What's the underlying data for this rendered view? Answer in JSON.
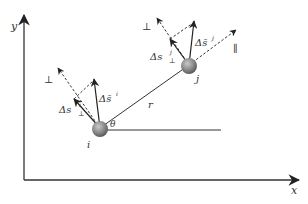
{
  "diagram": {
    "axes": {
      "x_label": "x",
      "y_label": "y"
    },
    "particles": [
      {
        "id": "i",
        "label": "i"
      },
      {
        "id": "j",
        "label": "j"
      }
    ],
    "separation_label": "r",
    "angle_label": "θ",
    "particle_i": {
      "perp_disp_label_main": "Δs",
      "perp_disp_label_sub": "⊥",
      "perp_disp_label_sup": "i",
      "disp_label_main": "Δs̄",
      "disp_label_sup": "i",
      "perp_direction_label": "⊥"
    },
    "particle_j": {
      "perp_disp_label_main": "Δs",
      "perp_disp_label_sub": "⊥",
      "perp_disp_label_sup": "j",
      "disp_label_main": "Δs̄",
      "disp_label_sup": "j",
      "perp_direction_label": "⊥",
      "parallel_direction_label": "∥"
    },
    "colors": {
      "line": "#333333",
      "particle_fill": "#8a8a8a",
      "particle_highlight": "#b8b8b8"
    }
  }
}
